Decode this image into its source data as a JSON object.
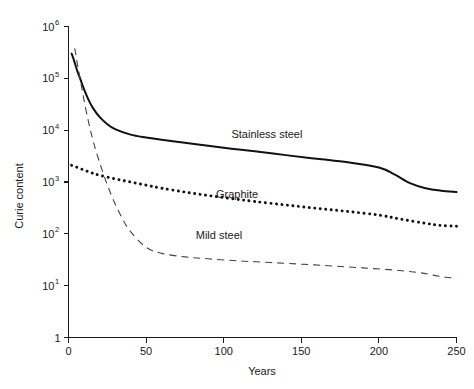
{
  "chart_data": {
    "type": "line",
    "title": "",
    "xlabel": "Years",
    "ylabel": "Curie content",
    "xlim": [
      0,
      250
    ],
    "ylim": [
      1,
      1000000
    ],
    "yscale": "log",
    "xscale": "linear",
    "grid": false,
    "legend": "inline-annotations",
    "xticks": [
      "0",
      "50",
      "100",
      "150",
      "200",
      "250"
    ],
    "xtick_values": [
      0,
      50,
      100,
      150,
      200,
      250
    ],
    "ytick_labels": [
      "1",
      "10",
      "10",
      "10",
      "10",
      "10",
      "10"
    ],
    "ytick_bases": [
      "1",
      "10",
      "10",
      "10",
      "10",
      "10",
      "10"
    ],
    "ytick_exponents": [
      "",
      "1",
      "2",
      "3",
      "4",
      "5",
      "6"
    ],
    "ytick_values": [
      1,
      10,
      100,
      1000,
      10000,
      100000,
      1000000
    ],
    "series": [
      {
        "name": "Stainless steel",
        "style": "solid",
        "color": "#111111",
        "label_text": "Stainless steel",
        "x": [
          2,
          3,
          4,
          5,
          6,
          8,
          10,
          13,
          16,
          20,
          25,
          30,
          40,
          50,
          60,
          75,
          90,
          105,
          120,
          140,
          160,
          180,
          200,
          210,
          220,
          230,
          240,
          250
        ],
        "y": [
          300000,
          250000,
          200000,
          160000,
          130000,
          90000,
          62000,
          38000,
          26000,
          18000,
          13000,
          10500,
          8200,
          7200,
          6500,
          5700,
          5000,
          4400,
          3900,
          3300,
          2800,
          2400,
          1900,
          1400,
          950,
          760,
          680,
          640
        ]
      },
      {
        "name": "Graphite",
        "style": "dotted",
        "color": "#111111",
        "label_text": "Graphite",
        "x": [
          2,
          5,
          10,
          15,
          20,
          30,
          40,
          50,
          60,
          75,
          90,
          105,
          120,
          140,
          160,
          180,
          200,
          215,
          230,
          240,
          250
        ],
        "y": [
          2100,
          1950,
          1700,
          1500,
          1350,
          1150,
          1000,
          870,
          760,
          640,
          550,
          480,
          420,
          360,
          310,
          270,
          230,
          190,
          160,
          145,
          140
        ]
      },
      {
        "name": "Mild steel",
        "style": "dashed",
        "color": "#444444",
        "label_text": "Mild steel",
        "x": [
          4,
          5,
          6,
          8,
          10,
          13,
          16,
          20,
          25,
          30,
          35,
          40,
          50,
          60,
          75,
          90,
          110,
          130,
          150,
          170,
          190,
          210,
          225,
          235,
          243,
          250
        ],
        "y": [
          380000,
          260000,
          170000,
          80000,
          38000,
          14000,
          6000,
          2400,
          880,
          380,
          190,
          110,
          55,
          42,
          36,
          33,
          30,
          28,
          26,
          24,
          22,
          20,
          18,
          16,
          14.5,
          14
        ]
      }
    ],
    "annotations": [
      {
        "text": "Stainless steel",
        "x": 105,
        "y": 7000
      },
      {
        "text": "Graphite",
        "x": 95,
        "y": 500
      },
      {
        "text": "Mild steel",
        "x": 82,
        "y": 80
      }
    ]
  }
}
